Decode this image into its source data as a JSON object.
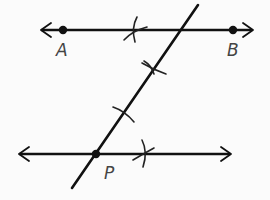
{
  "diagram": {
    "points": [
      {
        "id": "A",
        "label": "A",
        "x": 63,
        "y": 30,
        "label_x": 56,
        "label_y": 56
      },
      {
        "id": "B",
        "label": "B",
        "x": 233,
        "y": 30,
        "label_x": 227,
        "label_y": 56
      },
      {
        "id": "P",
        "label": "P",
        "x": 96,
        "y": 154,
        "label_x": 104,
        "label_y": 178
      }
    ],
    "lines": [
      {
        "id": "line-AB",
        "x1": 42,
        "y1": 30,
        "x2": 251,
        "y2": 30,
        "arrows": "both"
      },
      {
        "id": "line-through-P",
        "x1": 20,
        "y1": 154,
        "x2": 229,
        "y2": 154,
        "arrows": "both"
      },
      {
        "id": "transversal",
        "x1": 198,
        "y1": 5,
        "x2": 72,
        "y2": 188,
        "arrows": "none"
      }
    ],
    "construction_marks": [
      {
        "id": "arc-top-line",
        "on": "line-AB"
      },
      {
        "id": "arc-transversal-upper",
        "on": "transversal"
      },
      {
        "id": "arc-transversal-lower",
        "on": "transversal"
      },
      {
        "id": "arc-bottom-line",
        "on": "line-through-P"
      }
    ],
    "colors": {
      "stroke": "#111111",
      "label": "#444444",
      "background": "#fbfbfb"
    }
  }
}
